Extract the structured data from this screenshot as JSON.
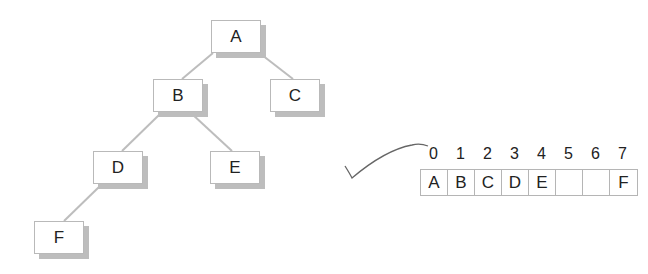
{
  "tree": {
    "nodes": [
      {
        "id": "A",
        "label": "A"
      },
      {
        "id": "B",
        "label": "B"
      },
      {
        "id": "C",
        "label": "C"
      },
      {
        "id": "D",
        "label": "D"
      },
      {
        "id": "E",
        "label": "E"
      },
      {
        "id": "F",
        "label": "F"
      }
    ],
    "edges": [
      [
        "A",
        "B"
      ],
      [
        "A",
        "C"
      ],
      [
        "B",
        "D"
      ],
      [
        "B",
        "E"
      ],
      [
        "D",
        "F"
      ]
    ]
  },
  "array": {
    "indices": [
      "0",
      "1",
      "2",
      "3",
      "4",
      "5",
      "6",
      "7"
    ],
    "cells": [
      "A",
      "B",
      "C",
      "D",
      "E",
      "",
      "",
      "F"
    ]
  },
  "annotation": {
    "checkmark": "check-mark-icon"
  },
  "colors": {
    "edge": "#bdbdbd",
    "border": "#b9b9b9",
    "shadow": "#bdbdbd",
    "text": "#222222"
  }
}
